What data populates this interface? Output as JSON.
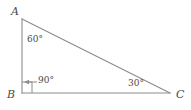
{
  "figure": {
    "type": "right-triangle-diagram",
    "background_color": "#ffffff",
    "stroke_color": "#8c8c8c",
    "text_color": "#4a4a4a",
    "vertices": {
      "A": {
        "label": "A",
        "x": 22,
        "y": 19
      },
      "B": {
        "label": "B",
        "x": 22,
        "y": 93
      },
      "C": {
        "label": "C",
        "x": 170,
        "y": 93
      }
    },
    "angles": {
      "at_A": "60°",
      "at_B": "90°",
      "at_C": "30°"
    },
    "markers": {
      "right_angle_square": "right-angle-square-marker",
      "pointer_arrow": "arrow-pointing-left-to-right-angle"
    },
    "sides": [
      {
        "name": "AB",
        "from": "A",
        "to": "B"
      },
      {
        "name": "BC",
        "from": "B",
        "to": "C"
      },
      {
        "name": "AC",
        "from": "A",
        "to": "C"
      }
    ]
  }
}
